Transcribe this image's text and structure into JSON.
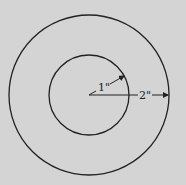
{
  "diagram": {
    "type": "concentric-circles",
    "background": "#d4d4d4",
    "stroke": "#222222",
    "center": [
      89,
      95
    ],
    "inner_radius_label": "1\"",
    "outer_radius_label": "2\"",
    "inner_radius_value": 1,
    "outer_radius_value": 2,
    "unit": "inch"
  }
}
